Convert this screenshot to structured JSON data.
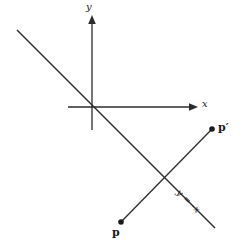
{
  "figure": {
    "background_color": "#ffffff",
    "stroke_color": "#2b2b2b",
    "width": 240,
    "height": 243
  },
  "axes": {
    "x_axis": {
      "label": "x",
      "start": [
        68,
        107
      ],
      "end": [
        198,
        107
      ],
      "arrow": "right"
    },
    "y_axis": {
      "label": "y",
      "start": [
        92,
        130
      ],
      "end": [
        92,
        16
      ],
      "arrow": "up"
    },
    "origin": [
      92,
      107
    ]
  },
  "lines": [
    {
      "name": "mirror-line",
      "label": "y = -x",
      "equation": "y = -x",
      "start": [
        17,
        30
      ],
      "end": [
        215,
        228
      ],
      "label_rotation_deg": 45
    },
    {
      "name": "reflection-segment",
      "label": "",
      "start": [
        121,
        222
      ],
      "end": [
        212,
        129
      ]
    }
  ],
  "points": [
    {
      "name": "p",
      "label": "p",
      "position": [
        121,
        222
      ],
      "label_offset": [
        -9,
        5
      ]
    },
    {
      "name": "p-prime",
      "label": "p′",
      "position": [
        212,
        129
      ],
      "label_offset": [
        6,
        -7
      ]
    }
  ]
}
